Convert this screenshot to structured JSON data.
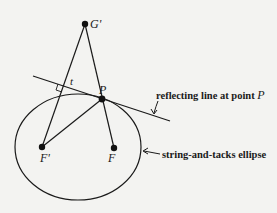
{
  "diagram": {
    "points": {
      "G_prime": {
        "label": "G'",
        "x": 85,
        "y": 24
      },
      "P": {
        "label": "P",
        "x": 102,
        "y": 99
      },
      "F_prime": {
        "label": "F'",
        "x": 42,
        "y": 147
      },
      "F": {
        "label": "F",
        "x": 114,
        "y": 148
      }
    },
    "segment_label": "t",
    "annotations": {
      "reflecting_line": {
        "text": "reflecting line at point ",
        "point": "P"
      },
      "ellipse": {
        "text": "string-and-tacks ellipse"
      }
    },
    "colors": {
      "stroke": "#1a1a1a",
      "background": "#f3f3f1"
    }
  }
}
